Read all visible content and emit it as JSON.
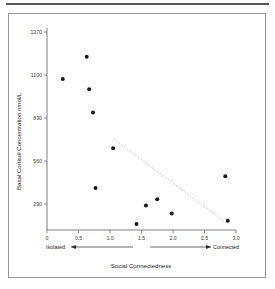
{
  "figure": {
    "caption": ""
  },
  "chart_data": {
    "type": "scatter",
    "title": "",
    "xlabel": "Social Connectedness",
    "ylabel": "Basal Cortisol Concentration  nmol/L",
    "xlim": [
      0,
      3.0
    ],
    "ylim": [
      20,
      1370
    ],
    "grid": false,
    "legend": null,
    "x_ticks": [
      "0",
      "0.5",
      "1.0",
      "1.5",
      "2.0",
      "2.5",
      "3.0"
    ],
    "x_tick_values": [
      0,
      0.5,
      1.0,
      1.5,
      2.0,
      2.5,
      3.0
    ],
    "y_ticks": [
      "1370",
      "1100",
      "830",
      "560",
      "290"
    ],
    "y_tick_values": [
      1370,
      1100,
      830,
      560,
      290
    ],
    "axis_end_labels": {
      "left": "Isolated",
      "right": "Connected"
    },
    "points": [
      {
        "x": 0.25,
        "y": 1075
      },
      {
        "x": 0.63,
        "y": 1215
      },
      {
        "x": 0.67,
        "y": 1010
      },
      {
        "x": 0.73,
        "y": 865
      },
      {
        "x": 0.77,
        "y": 390
      },
      {
        "x": 1.05,
        "y": 640
      },
      {
        "x": 1.42,
        "y": 165
      },
      {
        "x": 1.57,
        "y": 280
      },
      {
        "x": 1.75,
        "y": 320
      },
      {
        "x": 1.98,
        "y": 230
      },
      {
        "x": 2.83,
        "y": 465
      },
      {
        "x": 2.87,
        "y": 185
      }
    ],
    "trend_line": {
      "x1": 1.05,
      "y1": 700,
      "x2": 2.87,
      "y2": 165,
      "style": "dotted",
      "color": "#c3c3c6"
    },
    "colors": {
      "point": "#1a1a1c",
      "axis": "#6f6f72",
      "text": "#1c1c1e",
      "frame": "#9a9a9c",
      "rule": "#58585a"
    }
  }
}
